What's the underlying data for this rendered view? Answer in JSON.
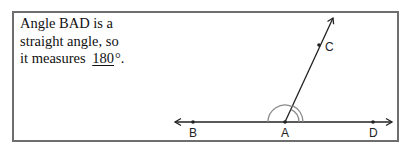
{
  "caption": {
    "line1": "Angle BAD is a",
    "line2": "straight angle, so",
    "line3_prefix": "it measures",
    "answer": "180",
    "line3_suffix": "°."
  },
  "diagram": {
    "points": [
      {
        "name": "B",
        "label": "B"
      },
      {
        "name": "A",
        "label": "A"
      },
      {
        "name": "D",
        "label": "D"
      },
      {
        "name": "C",
        "label": "C"
      }
    ],
    "colors": {
      "line": "#222222",
      "arc": "#8a8a8a",
      "border": "#6e6e6e"
    }
  }
}
